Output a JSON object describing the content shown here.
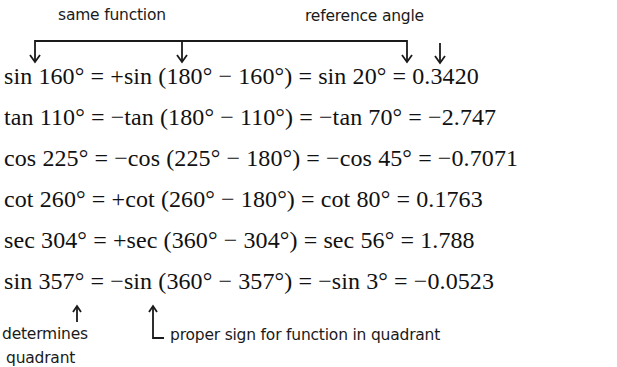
{
  "annotations": {
    "same_function": "same function",
    "reference_angle": "reference angle",
    "determines": "determines",
    "quadrant": "quadrant",
    "proper_sign": "proper sign for function in quadrant"
  },
  "equations": [
    {
      "text": "sin 160° =  +sin (180° − 160°) = sin 20° = 0.3420"
    },
    {
      "text": "tan 110° =  −tan (180° − 110°) = −tan 70° = −2.747"
    },
    {
      "text": "cos 225° = −cos (225° − 180°) = −cos 45° = −0.7071"
    },
    {
      "text": "cot 260° =  +cot (260° − 180°) = cot 80° = 0.1763"
    },
    {
      "text": "sec 304° =  +sec (360° − 304°) = sec 56° = 1.788"
    },
    {
      "text": "sin 357° =  −sin (360° − 357°) = −sin 3° = −0.0523"
    }
  ],
  "colors": {
    "ink": "#1a1a1a",
    "background": "#ffffff"
  }
}
